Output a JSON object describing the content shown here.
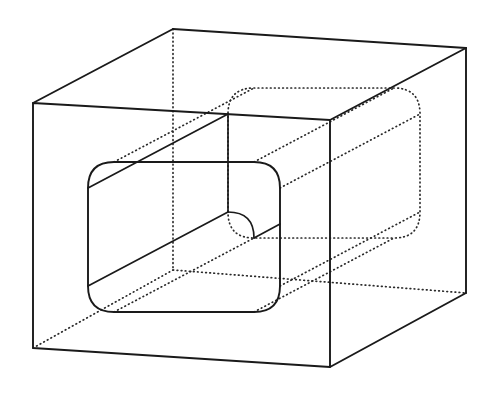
{
  "document": {
    "title": "Orthographic pictorial of a rectangular block with a rounded-rectangular through hole",
    "background_color": "#ffffff",
    "line_color": "#1a1a1a",
    "hidden_line_color": "#2a2a2a",
    "width": 491,
    "height": 395
  },
  "figure": {
    "name": "block-with-rounded-through-hole",
    "projection": "oblique pictorial (cabinet-style), receding axis up-and-right",
    "style": {
      "visible_line": "solid",
      "hidden_line": "dotted",
      "fill": "none"
    },
    "parts": [
      {
        "name": "outer-block",
        "description": "Rectangular prism shown transparent; front face is a near-rectangle, receding edges go up and to the right.",
        "front_face": [
          [
            33,
            103
          ],
          [
            330,
            120
          ],
          [
            330,
            367
          ],
          [
            33,
            348
          ]
        ],
        "back_face": [
          [
            173,
            29
          ],
          [
            466,
            48
          ],
          [
            466,
            293
          ],
          [
            173,
            270
          ]
        ],
        "visible_edges": [
          "front-top",
          "front-left",
          "front-right",
          "front-bottom",
          "top-left-receding",
          "top-right-receding",
          "back-top",
          "back-right-vertical",
          "bottom-right-receding",
          "back-bottom-right"
        ],
        "hidden_edges": [
          "back-left-vertical",
          "back-bottom",
          "bottom-left-receding"
        ]
      },
      {
        "name": "through-hole",
        "description": "Rounded-rectangular prismatic hole passing all the way through the block along the receding axis.",
        "front_opening": {
          "x": 88,
          "y": 162,
          "width": 192,
          "height": 150,
          "corner_radius": 26,
          "visible": true
        },
        "back_opening": {
          "x": 228,
          "y": 88,
          "width": 192,
          "height": 150,
          "corner_radius": 26,
          "visible": false,
          "line_style": "dotted"
        },
        "interior_visible_walls": [
          "top-inner-wall",
          "left-inner-wall"
        ],
        "interior_hidden_walls": [
          "bottom-inner-wall",
          "right-inner-wall"
        ]
      }
    ],
    "annotations": [],
    "labels": [],
    "dimensions": []
  }
}
